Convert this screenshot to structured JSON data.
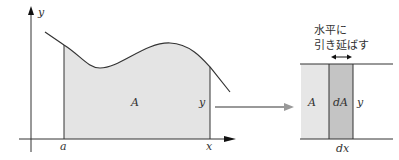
{
  "diagram": {
    "left_graph": {
      "y_axis_label": "y",
      "x_axis_label": "x",
      "lower_bound_label": "a",
      "upper_bound_label": "x",
      "area_label": "A",
      "height_label": "y"
    },
    "right_graph": {
      "annotation_line1": "水平に",
      "annotation_line2": "引き延ばす",
      "area_label": "A",
      "strip_label": "dA",
      "height_label": "y",
      "width_label": "dx"
    },
    "colors": {
      "area_fill": "#e4e4e4",
      "strip_fill": "#c4c4c4",
      "area_rect_fill": "#e6e6e6",
      "line": "#333333",
      "arrow": "#999999"
    }
  }
}
